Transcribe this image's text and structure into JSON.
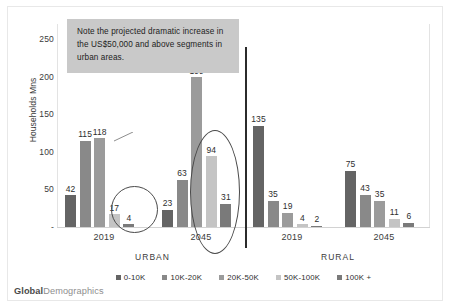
{
  "chart_data": {
    "type": "bar",
    "title": "",
    "xlabel": "",
    "ylabel": "Households  Mns",
    "ylim": [
      0,
      270
    ],
    "yticks": [
      "250",
      "200",
      "150",
      "100",
      "50",
      "-"
    ],
    "ytick_values": [
      250,
      200,
      150,
      100,
      50,
      0
    ],
    "grid": false,
    "legend_position": "bottom",
    "categories": [
      "2019",
      "2045",
      "2019",
      "2045"
    ],
    "group_headers": [
      "URBAN",
      "RURAL"
    ],
    "series": [
      {
        "name": "0-10K",
        "color": "#646464",
        "values": [
          42,
          23,
          135,
          75
        ]
      },
      {
        "name": "10K-20K",
        "color": "#898989",
        "values": [
          115,
          63,
          35,
          43
        ]
      },
      {
        "name": "20K-50K",
        "color": "#9b9b9b",
        "values": [
          118,
          199,
          19,
          35
        ]
      },
      {
        "name": "50K-100K",
        "color": "#c4c4c4",
        "values": [
          17,
          94,
          4,
          11
        ]
      },
      {
        "name": "100K +",
        "color": "#7a7a7a",
        "values": [
          4,
          31,
          2,
          6
        ]
      }
    ],
    "annotations": {
      "note": "Note the projected dramatic increase in the US$50,000 and above segments in urban areas.",
      "ellipse_1_target": "urban-2019-50K-100K-and-100K-plus",
      "ellipse_2_target": "urban-2045-50K-100K-and-100K-plus",
      "divider": "urban-rural-separator"
    }
  },
  "brand": {
    "part1": "Global",
    "part2": "Demographics"
  }
}
